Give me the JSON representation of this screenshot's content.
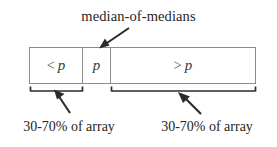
{
  "figure": {
    "title": "median-of-medians",
    "background_color": "#ffffff",
    "line_color": "#8c8c8c",
    "ink_color": "#262626"
  },
  "partition": {
    "cells": [
      {
        "name": "less-than-pivot",
        "operator": "<",
        "symbol": "p",
        "label": "< p"
      },
      {
        "name": "pivot",
        "operator": "",
        "symbol": "p",
        "label": "p"
      },
      {
        "name": "greater-than-pivot",
        "operator": ">",
        "symbol": "p",
        "label": "> p"
      }
    ]
  },
  "annotations": {
    "pivot_callout": "median-of-medians",
    "left_bracket_caption": "30-70% of array",
    "right_bracket_caption": "30-70% of array"
  }
}
